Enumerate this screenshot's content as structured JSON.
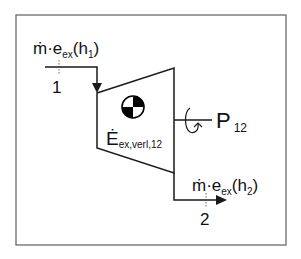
{
  "diagram": {
    "type": "turbine-control-volume",
    "colors": {
      "line": "#1a1a1a",
      "frame": "#6a6a6a",
      "background": "#ffffff"
    },
    "inlet": {
      "label_main": "ṁ·e",
      "label_sub": "ex",
      "label_paren_open": "(h",
      "label_paren_sub": "1",
      "label_paren_close": ")",
      "state_number": "1"
    },
    "outlet": {
      "label_main": "ṁ·e",
      "label_sub": "ex",
      "label_paren_open": "(h",
      "label_paren_sub": "2",
      "label_paren_close": ")",
      "state_number": "2"
    },
    "power": {
      "label_main": "P",
      "label_sub": "12"
    },
    "exergy_loss": {
      "label_main": "Ė",
      "label_sub": "ex,verl,12"
    },
    "center_symbol": "center-of-mass-icon"
  }
}
